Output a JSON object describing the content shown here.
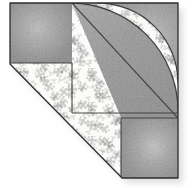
{
  "artwork": {
    "title": "Quilt block patch",
    "subject": "pieced fabric quilt block with quarter-circle fan arc",
    "width_px": 194,
    "height_px": 188,
    "background_color": "#ffffff"
  },
  "palette": {
    "solid_gray": "#a6a6a6",
    "solid_gray_dark": "#8f8f8f",
    "solid_gray_light": "#bdbdbd",
    "print_background": "#fbfbf9",
    "print_motif": "#9a9a9a",
    "print_motif_light": "#b9b9b9",
    "seam_line": "#3a3a3a",
    "outline": "#2e2e2e",
    "shadow": "#d7d7d7"
  },
  "block_outline": {
    "name": "block-silhouette",
    "description": "square with lower-left corner trimmed on the bias",
    "points": "10,3 178,3 178,178 122,178 10,64"
  },
  "patches": [
    {
      "id": "patch-top-left-solid",
      "label": "Top left solid square",
      "fabric": "solid gray",
      "fill": "#a6a6a6",
      "points": "10,3 72,3 72,63 10,63"
    },
    {
      "id": "patch-bottom-right-solid",
      "label": "Bottom right solid square",
      "fabric": "solid gray",
      "fill": "#a6a6a6",
      "points": "121,118 178,118 178,178 121,178"
    },
    {
      "id": "patch-upper-right-background",
      "label": "Upper right solid background triangle",
      "fabric": "solid gray",
      "fill": "#a6a6a6",
      "points": "72,3 178,3 178,118 121,118"
    },
    {
      "id": "patch-print-field",
      "label": "Printed floral field",
      "fabric": "gray floral print on white",
      "fill": "#fbfbf9",
      "points": "10,64 72,3 178,118 178,178 122,178"
    }
  ],
  "fan_arc": {
    "id": "fan-arc",
    "label": "Quarter circle fan arc",
    "center_x": 178,
    "center_y": 3,
    "outer_radius": 108,
    "inner_radius": 80,
    "band_fabric": "gray floral print on white",
    "core_fabric": "solid gray"
  },
  "seams": [
    {
      "id": "seam-main-diagonal",
      "label": "Main bias diagonal seam",
      "x1": 72,
      "y1": 3,
      "x2": 178,
      "y2": 118
    },
    {
      "id": "seam-vertical-center",
      "label": "Vertical seam below top left square",
      "x1": 72,
      "y1": 63,
      "x2": 72,
      "y2": 113
    },
    {
      "id": "seam-horizontal-center",
      "label": "Horizontal seam across print field",
      "x1": 10,
      "y1": 63,
      "x2": 72,
      "y2": 63
    },
    {
      "id": "seam-horizontal-lower",
      "label": "Lower horizontal seam above bottom square",
      "x1": 72,
      "y1": 113,
      "x2": 178,
      "y2": 113
    },
    {
      "id": "seam-bottom-square-left",
      "label": "Left seam of bottom right square",
      "x1": 121,
      "y1": 118,
      "x2": 121,
      "y2": 178
    },
    {
      "id": "seam-bottom-square-top",
      "label": "Top seam of bottom right square",
      "x1": 121,
      "y1": 118,
      "x2": 178,
      "y2": 118
    }
  ],
  "shadow": {
    "id": "drop-shadow",
    "label": "Soft drop shadow beneath block",
    "color": "#d9d9d9",
    "offset_x": 4,
    "offset_y": 5
  }
}
